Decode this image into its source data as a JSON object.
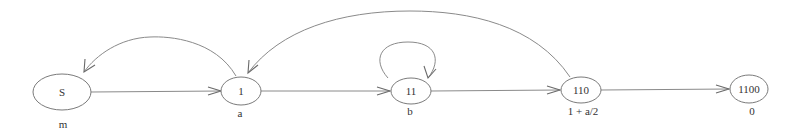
{
  "diagram": {
    "type": "state-transition-graph",
    "colors": {
      "line": "#8a8a8a",
      "node_border": "#7a7a7a",
      "text": "#333333",
      "background": "#ffffff"
    },
    "nodes": [
      {
        "id": "S",
        "label": "S",
        "value": "m"
      },
      {
        "id": "1",
        "label": "1",
        "value": "a"
      },
      {
        "id": "11",
        "label": "11",
        "value": "b"
      },
      {
        "id": "110",
        "label": "110",
        "value": "1 + a/2"
      },
      {
        "id": "1100",
        "label": "1100",
        "value": "0"
      }
    ],
    "edges": [
      {
        "from": "S",
        "to": "1"
      },
      {
        "from": "1",
        "to": "11"
      },
      {
        "from": "11",
        "to": "11"
      },
      {
        "from": "11",
        "to": "110"
      },
      {
        "from": "110",
        "to": "1100"
      },
      {
        "from": "1",
        "to": "S"
      },
      {
        "from": "110",
        "to": "1"
      }
    ]
  }
}
